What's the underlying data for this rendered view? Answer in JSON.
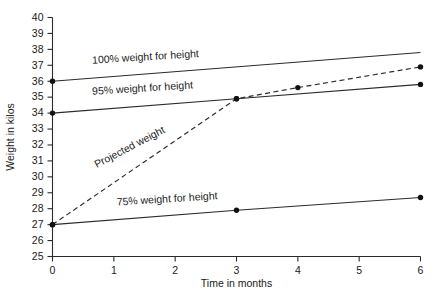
{
  "chart_data": {
    "type": "line",
    "title": "",
    "xlabel": "Time in months",
    "ylabel": "Weight in kilos",
    "xlim": [
      0,
      6
    ],
    "ylim": [
      25,
      40
    ],
    "x_ticks": [
      "0",
      "1",
      "2",
      "3",
      "4",
      "5",
      "6"
    ],
    "y_ticks": [
      "25",
      "26",
      "27",
      "28",
      "29",
      "30",
      "31",
      "32",
      "33",
      "34",
      "35",
      "36",
      "37",
      "38",
      "39",
      "40"
    ],
    "grid": false,
    "legend": "inline-annotations",
    "series": [
      {
        "name": "100% weight for height",
        "style": "solid",
        "label": "100% weight for height",
        "x": [
          0,
          6
        ],
        "values": [
          36.0,
          37.8
        ],
        "markers_x": [
          0
        ],
        "markers_y": [
          36.0
        ]
      },
      {
        "name": "95% weight for height",
        "style": "solid",
        "label": "95% weight for height",
        "x": [
          0,
          3,
          6
        ],
        "values": [
          34.0,
          34.9,
          35.8
        ],
        "markers_x": [
          0,
          3,
          6
        ],
        "markers_y": [
          34.0,
          34.9,
          35.8
        ]
      },
      {
        "name": "Projected weight",
        "style": "dashed",
        "label": "Projected weight",
        "x": [
          0,
          3,
          4,
          6
        ],
        "values": [
          27.0,
          34.9,
          35.6,
          36.9
        ],
        "markers_x": [
          0,
          3,
          4,
          6
        ],
        "markers_y": [
          27.0,
          34.9,
          35.6,
          36.9
        ]
      },
      {
        "name": "75% weight for height",
        "style": "solid",
        "label": "75% weight for height",
        "x": [
          0,
          3,
          6
        ],
        "values": [
          27.0,
          27.9,
          28.7
        ],
        "markers_x": [
          0,
          3,
          6
        ],
        "markers_y": [
          27.0,
          27.9,
          28.7
        ]
      }
    ],
    "annotations": [
      {
        "text": "100% weight for height",
        "x": 0.65,
        "y": 37.1,
        "rotation": -3.6
      },
      {
        "text": "95% weight for height",
        "x": 0.65,
        "y": 35.15,
        "rotation": -3.6
      },
      {
        "text": "Projected weight",
        "x": 0.72,
        "y": 30.55,
        "rotation": -27.5
      },
      {
        "text": "75% weight for height",
        "x": 1.05,
        "y": 28.2,
        "rotation": -3.6
      }
    ],
    "colors": {
      "line": "#2b2b2b",
      "marker": "#111111",
      "axis": "#2b2b2b",
      "text": "#1a1a1a",
      "background": "#ffffff"
    }
  }
}
